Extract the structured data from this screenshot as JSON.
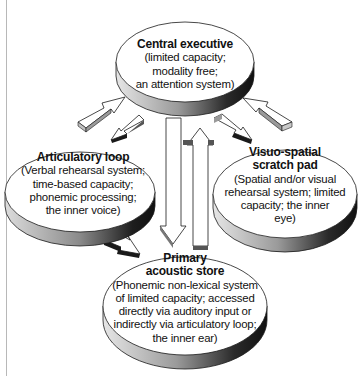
{
  "diagram": {
    "type": "working-memory-model",
    "components": [
      {
        "id": "central-executive",
        "title": "Central executive",
        "description": "(limited capacity;\nmodality free;\nan attention system)"
      },
      {
        "id": "articulatory-loop",
        "title": "Articulatory loop",
        "description": "(Verbal rehearsal system;\ntime-based capacity;\nphonemic processing;\nthe inner voice)"
      },
      {
        "id": "visuo-spatial-scratch-pad",
        "title": "Visuo-spatial\nscratch pad",
        "description": "(Spatial and/or visual\nrehearsal system; limited\ncapacity; the inner\neye)"
      },
      {
        "id": "primary-acoustic-store",
        "title": "Primary\nacoustic store",
        "description": "(Phonemic non-lexical system\nof limited capacity; accessed\ndirectly via auditory input or\nindirectly via articulatory loop;\nthe inner ear)"
      }
    ],
    "connections": [
      {
        "from": "articulatory-loop",
        "to": "central-executive"
      },
      {
        "from": "central-executive",
        "to": "articulatory-loop"
      },
      {
        "from": "visuo-spatial-scratch-pad",
        "to": "central-executive"
      },
      {
        "from": "central-executive",
        "to": "visuo-spatial-scratch-pad"
      },
      {
        "from": "central-executive",
        "to": "primary-acoustic-store"
      },
      {
        "from": "primary-acoustic-store",
        "to": "central-executive"
      },
      {
        "from": "articulatory-loop",
        "to": "primary-acoustic-store"
      }
    ],
    "colors": {
      "fill": "#ffffff",
      "stroke": "#1a1a1a",
      "shadow_dark": "#1a1a1a",
      "shadow_mid": "#8a8a8a",
      "shadow_light": "#d8d8d8",
      "rule": "#b8b8b8"
    }
  }
}
